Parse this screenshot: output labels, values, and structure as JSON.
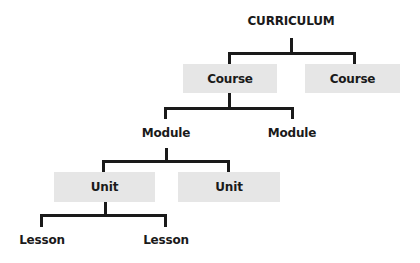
{
  "diagram": {
    "type": "hierarchy-tree",
    "root": {
      "label": "CURRICULUM"
    },
    "courses": [
      {
        "label": "Course"
      },
      {
        "label": "Course"
      }
    ],
    "modules": [
      {
        "label": "Module"
      },
      {
        "label": "Module"
      }
    ],
    "units": [
      {
        "label": "Unit"
      },
      {
        "label": "Unit"
      }
    ],
    "lessons": [
      {
        "label": "Lesson"
      },
      {
        "label": "Lesson"
      }
    ],
    "colors": {
      "box_fill": "#e6e6e6",
      "line": "#1a1a1a",
      "text": "#1a1a1a",
      "background": "#ffffff"
    }
  }
}
